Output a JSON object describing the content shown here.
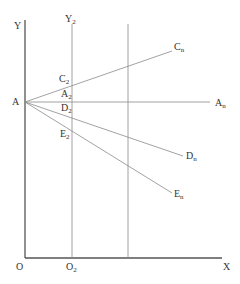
{
  "axes": {
    "y_label": "Y",
    "x_label": "X",
    "origin_label": "O",
    "y2_label": "Y",
    "y2_sub": "2",
    "o2_label": "O",
    "o2_sub": "2"
  },
  "point_A": {
    "label": "A"
  },
  "rays": [
    {
      "start": "C",
      "start_sub": "2",
      "end": "C",
      "end_sub": "n"
    },
    {
      "start": "A",
      "start_sub": "2",
      "end": "A",
      "end_sub": "n"
    },
    {
      "start": "D",
      "start_sub": "2",
      "end": "D",
      "end_sub": "n"
    },
    {
      "start": "E",
      "start_sub": "2",
      "end": "E",
      "end_sub": "n"
    }
  ],
  "colors": {
    "axis": "#555555",
    "line": "#8a8a8a",
    "text": "#333333"
  }
}
